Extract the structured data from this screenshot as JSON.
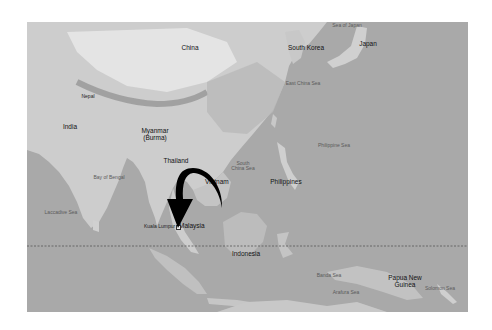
{
  "map": {
    "colors": {
      "ocean": "#a9a9a9",
      "land": "#cfcfcf",
      "highland": "#e6e6e6",
      "mountain": "#9a9a9a",
      "arrow": "#000000",
      "equator": "#555555"
    },
    "countries": [
      {
        "id": "china",
        "label": "China"
      },
      {
        "id": "south-korea",
        "label": "South Korea"
      },
      {
        "id": "japan",
        "label": "Japan"
      },
      {
        "id": "nepal",
        "label": "Nepal"
      },
      {
        "id": "india",
        "label": "India"
      },
      {
        "id": "myanmar",
        "label": "Myanmar\n(Burma)",
        "line1": "Myanmar",
        "line2": "(Burma)"
      },
      {
        "id": "thailand",
        "label": "Thailand"
      },
      {
        "id": "vietnam",
        "label": "Vietnam"
      },
      {
        "id": "philippines",
        "label": "Philippines"
      },
      {
        "id": "malaysia",
        "label": "Malaysia"
      },
      {
        "id": "indonesia",
        "label": "Indonesia"
      },
      {
        "id": "papua-new-guinea",
        "label": "Papua New Guinea",
        "line1": "Papua New",
        "line2": "Guinea"
      }
    ],
    "seas": [
      {
        "id": "sea-of-japan",
        "label": "Sea of Japan"
      },
      {
        "id": "east-china-sea",
        "label": "East China Sea"
      },
      {
        "id": "philippine-sea",
        "label": "Philippine Sea"
      },
      {
        "id": "south-china-sea",
        "label": "South China Sea",
        "line1": "South",
        "line2": "China Sea"
      },
      {
        "id": "bay-of-bengal",
        "label": "Bay of Bengal"
      },
      {
        "id": "laccadive-sea",
        "label": "Laccadive Sea"
      },
      {
        "id": "banda-sea",
        "label": "Banda Sea"
      },
      {
        "id": "arafura-sea",
        "label": "Arafura Sea"
      },
      {
        "id": "solomon-sea",
        "label": "Solomon Sea"
      }
    ],
    "cities": [
      {
        "id": "kuala-lumpur",
        "label": "Kuala Lumpur"
      }
    ],
    "annotations": {
      "arrow": "Curved arrow pointing to Kuala Lumpur, Malaysia",
      "equator": "Dashed equator line"
    }
  }
}
